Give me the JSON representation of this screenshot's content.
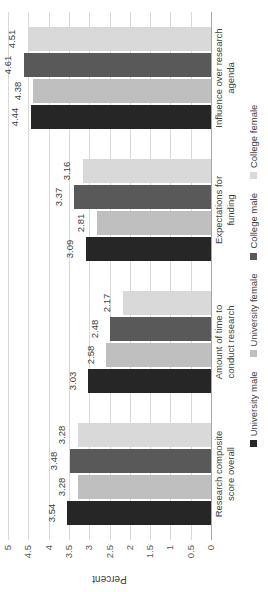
{
  "chart_data": {
    "type": "bar",
    "title": "",
    "subtitle": "",
    "xlabel": "",
    "ylabel": "Percent",
    "ylim": [
      0,
      5
    ],
    "ytick_labels": [
      "5",
      "4.5",
      "4",
      "3.5",
      "3",
      "2.5",
      "2",
      "1.5",
      "1",
      "0.5",
      "0"
    ],
    "ytick_values": [
      5,
      4.5,
      4,
      3.5,
      3,
      2.5,
      2,
      1.5,
      1,
      0.5,
      0
    ],
    "grid": true,
    "orientation": "vertical-grouped",
    "rotation_note": "chart rendered rotated 90 degrees counter-clockwise",
    "legend_position": "bottom",
    "categories": [
      "Research composite score overall",
      "Amount of time to conduct research",
      "Expectations for funding",
      "Influence over research agenda"
    ],
    "category_lines": [
      [
        "Research composite",
        "score overall"
      ],
      [
        "Amount of time to",
        "conduct research"
      ],
      [
        "Expectations for",
        "funding"
      ],
      [
        "Influence over research",
        "agenda"
      ]
    ],
    "series": [
      {
        "name": "University male",
        "color": "#262626",
        "values": [
          3.54,
          3.03,
          3.09,
          4.44
        ],
        "labels": [
          "3.54",
          "3.03",
          "3.09",
          "4.44"
        ]
      },
      {
        "name": "University female",
        "color": "#bfbfbf",
        "values": [
          3.28,
          2.58,
          2.81,
          4.38
        ],
        "labels": [
          "3.28",
          "2.58",
          "2.81",
          "4.38"
        ]
      },
      {
        "name": "College male",
        "color": "#595959",
        "values": [
          3.48,
          2.48,
          3.37,
          4.61
        ],
        "labels": [
          "3.48",
          "2.48",
          "3.37",
          "4.61"
        ]
      },
      {
        "name": "College female",
        "color": "#d9d9d9",
        "values": [
          3.28,
          2.17,
          3.16,
          4.51
        ],
        "labels": [
          "3.28",
          "2.17",
          "3.16",
          "4.51"
        ]
      }
    ]
  },
  "colors": {
    "gridline": "#d9d9d9",
    "axis": "#a6a6a6",
    "text": "#404040",
    "tick_text": "#595959",
    "background": "#ffffff"
  }
}
